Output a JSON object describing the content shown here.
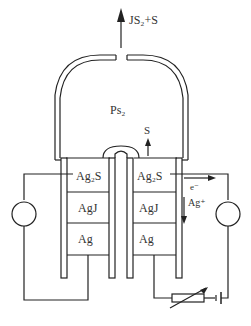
{
  "diagram": {
    "type": "electrochemical-cell-schematic",
    "labels": {
      "top_output": "JS₂+S",
      "chamber_gas": "Ps₂",
      "sulfur_arrow": "S",
      "electron": "e⁻",
      "silver_ion": "Ag⁺"
    },
    "left_cell": {
      "layers": [
        "Ag₂S",
        "AgJ",
        "Ag"
      ]
    },
    "right_cell": {
      "layers": [
        "Ag₂S",
        "AgJ",
        "Ag"
      ]
    },
    "components": {
      "left_meter": "meter-circle",
      "right_meter": "meter-circle",
      "variable_resistor": "variable-resistor",
      "battery": "battery"
    },
    "colors": {
      "line": "#222222",
      "text": "#333333",
      "background": "#ffffff"
    }
  }
}
